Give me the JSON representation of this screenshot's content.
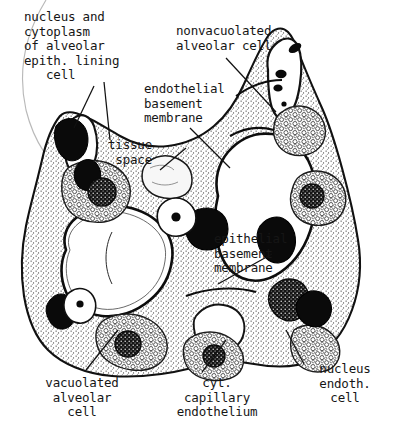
{
  "figure": {
    "medium": "line drawing, black ink on white paper",
    "background_color": "#ffffff",
    "ink_color": "#161616",
    "width": 397,
    "height": 441
  },
  "labels": {
    "nucleus_cytoplasm": "nucleus and\ncytoplasm\nof alveolar\nepith. lining\n   cell",
    "nonvacuolated_alveolar_cell": "nonvacuolated\nalveolar cell",
    "endothelial_basement_membrane": "endothelial\nbasement\nmembrane",
    "tissue_space": "tissue\n space",
    "epithelial_basement_membrane": "epithelial\nbasement\nmembrane",
    "vacuolated_alveolar_cell": "vacuolated\nalveolar\ncell",
    "cyt_capillary_endothelium": "cyt.\ncapillary\nendothelium",
    "nucleus_endoth_cell": "nucleus\nendoth.\ncell"
  },
  "structures": [
    {
      "name": "alveolar-air-space-central",
      "kind": "open-space"
    },
    {
      "name": "alveolar-air-space-upper-right",
      "kind": "open-space"
    },
    {
      "name": "alveolar-air-space-left",
      "kind": "open-space"
    },
    {
      "name": "capillary-lumen",
      "kind": "open-space"
    },
    {
      "name": "nucleus-dark",
      "kind": "nucleus",
      "fill": "solid-black"
    },
    {
      "name": "cytoplasm-stippled",
      "kind": "cytoplasm",
      "fill": "stipple"
    },
    {
      "name": "vacuole-cluster",
      "kind": "vacuoles",
      "fill": "bubbles"
    }
  ]
}
